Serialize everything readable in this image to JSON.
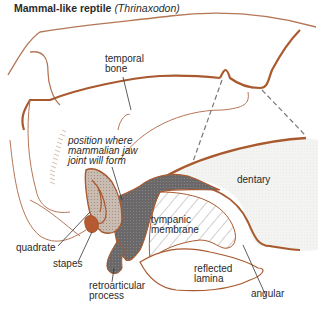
{
  "title": {
    "main": "Mammal-like reptile",
    "scientific": "(Thrinaxodon)"
  },
  "colors": {
    "bone_outline": "#a9592e",
    "bone_outline_light": "#b57656",
    "quadrate_fill": "#c9b8ae",
    "stapes_fill": "#b65a34",
    "articular_fill": "#6e6c6c",
    "dentary_fill": "#f2f2f0",
    "hatch": "#9a9a9a",
    "label_text": "#2a2a2a"
  },
  "labels": {
    "temporal_bone": [
      "temporal",
      "bone"
    ],
    "jaw_joint": [
      "position where",
      "mammalian jaw",
      "joint will form"
    ],
    "dentary": "dentary",
    "tympanic_membrane": [
      "tympanic",
      "membrane"
    ],
    "quadrate": "quadrate",
    "stapes": "stapes",
    "retroarticular_process": [
      "retroarticular",
      "process"
    ],
    "reflected_lamina": [
      "reflected",
      "lamina"
    ],
    "angular": "angular"
  }
}
